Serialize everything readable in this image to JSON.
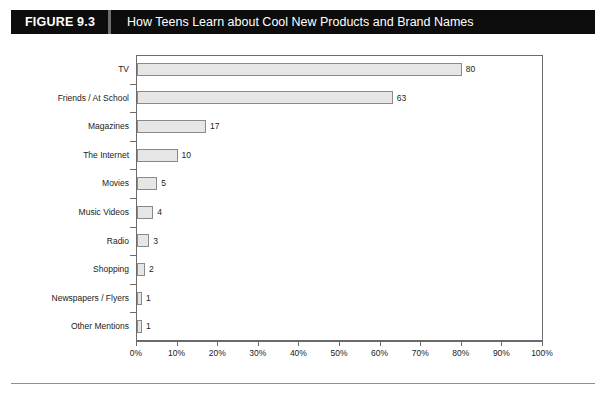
{
  "header": {
    "figure_number": "FIGURE 9.3",
    "title": "How Teens Learn about Cool New Products and Brand Names"
  },
  "chart_data": {
    "type": "bar",
    "orientation": "horizontal",
    "title": "How Teens Learn about Cool New Products and Brand Names",
    "xlabel": "",
    "ylabel": "",
    "xlim": [
      0,
      100
    ],
    "xtick_labels": [
      "0%",
      "10%",
      "20%",
      "30%",
      "40%",
      "50%",
      "60%",
      "70%",
      "80%",
      "90%",
      "100%"
    ],
    "xtick_values": [
      0,
      10,
      20,
      30,
      40,
      50,
      60,
      70,
      80,
      90,
      100
    ],
    "grid": false,
    "legend": null,
    "categories": [
      "TV",
      "Friends / At School",
      "Magazines",
      "The Internet",
      "Movies",
      "Music Videos",
      "Radio",
      "Shopping",
      "Newspapers / Flyers",
      "Other Mentions"
    ],
    "values": [
      80,
      63,
      17,
      10,
      5,
      4,
      3,
      2,
      1,
      1
    ],
    "value_labels": [
      "80",
      "63",
      "17",
      "10",
      "5",
      "4",
      "3",
      "2",
      "1",
      "1"
    ],
    "bar_fill": "#e6e6e6",
    "bar_border": "#8a8a8a"
  }
}
